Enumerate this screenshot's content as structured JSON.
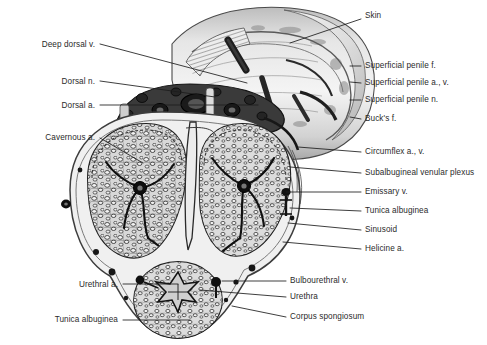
{
  "figure": {
    "width": 487,
    "height": 345,
    "background": "#ffffff",
    "ink_color": "#2b2b2b",
    "leader_color": "#1c1c1c"
  },
  "labels_left": [
    {
      "id": "deep-dorsal-v",
      "text": "Deep dorsal v.",
      "text_x": 95,
      "text_y": 46,
      "line": [
        [
          100,
          44
        ],
        [
          247,
          83
        ]
      ]
    },
    {
      "id": "dorsal-n",
      "text": "Dorsal n.",
      "text_x": 95,
      "text_y": 83,
      "line": [
        [
          100,
          81
        ],
        [
          215,
          97
        ]
      ]
    },
    {
      "id": "dorsal-a",
      "text": "Dorsal a.",
      "text_x": 95,
      "text_y": 107,
      "line": [
        [
          100,
          105
        ],
        [
          258,
          105
        ]
      ]
    },
    {
      "id": "cavernous-a",
      "text": "Cavernous a.",
      "text_x": 95,
      "text_y": 139,
      "line": [
        [
          100,
          138
        ],
        [
          143,
          163
        ]
      ]
    },
    {
      "id": "urethral-a",
      "text": "Urethral a.",
      "text_x": 118,
      "text_y": 286,
      "line": [
        [
          123,
          284
        ],
        [
          178,
          284
        ]
      ]
    },
    {
      "id": "tunica-albuginea-l",
      "text": "Tunica albuginea",
      "text_x": 118,
      "text_y": 321,
      "line": [
        [
          123,
          320
        ],
        [
          190,
          320
        ]
      ]
    }
  ],
  "labels_right": [
    {
      "id": "skin",
      "text": "Skin",
      "text_x": 365,
      "text_y": 17,
      "line": [
        [
          361,
          19
        ],
        [
          290,
          43
        ]
      ]
    },
    {
      "id": "superficial-penile-f",
      "text": "Superficial penile f.",
      "text_x": 365,
      "text_y": 67,
      "line": [
        [
          361,
          66
        ],
        [
          350,
          66
        ]
      ]
    },
    {
      "id": "superficial-penile-a-v",
      "text": "Superficial penile a., v.",
      "text_x": 365,
      "text_y": 84,
      "line": [
        [
          361,
          83
        ],
        [
          350,
          82
        ]
      ]
    },
    {
      "id": "superficial-penile-n",
      "text": "Superficial penile n.",
      "text_x": 365,
      "text_y": 101,
      "line": [
        [
          361,
          100
        ],
        [
          350,
          100
        ]
      ]
    },
    {
      "id": "bucks-f",
      "text": "Buck's f.",
      "text_x": 365,
      "text_y": 120,
      "line": [
        [
          361,
          119
        ],
        [
          350,
          117
        ]
      ]
    },
    {
      "id": "circumflex-a-v",
      "text": "Circumflex a., v.",
      "text_x": 365,
      "text_y": 153,
      "line": [
        [
          361,
          152
        ],
        [
          298,
          147
        ]
      ]
    },
    {
      "id": "subalbugineal-venular-plexus",
      "text": "Subalbugineal venular plexus",
      "text_x": 365,
      "text_y": 174,
      "line": [
        [
          361,
          173
        ],
        [
          290,
          167
        ]
      ]
    },
    {
      "id": "emissary-v",
      "text": "Emissary v.",
      "text_x": 365,
      "text_y": 193,
      "line": [
        [
          361,
          192
        ],
        [
          286,
          192
        ]
      ]
    },
    {
      "id": "tunica-albuginea-r",
      "text": "Tunica albuginea",
      "text_x": 365,
      "text_y": 212,
      "line": [
        [
          361,
          211
        ],
        [
          290,
          208
        ]
      ]
    },
    {
      "id": "sinusoid",
      "text": "Sinusoid",
      "text_x": 365,
      "text_y": 231,
      "line": [
        [
          361,
          230
        ],
        [
          288,
          223
        ]
      ]
    },
    {
      "id": "helicine-a",
      "text": "Helicine a.",
      "text_x": 365,
      "text_y": 250,
      "line": [
        [
          361,
          249
        ],
        [
          283,
          242
        ]
      ]
    },
    {
      "id": "bulbourethral-v",
      "text": "Bulbourethral v.",
      "text_x": 290,
      "text_y": 282,
      "line": [
        [
          286,
          281
        ],
        [
          222,
          281
        ]
      ]
    },
    {
      "id": "urethra",
      "text": "Urethra",
      "text_x": 290,
      "text_y": 298,
      "line": [
        [
          286,
          297
        ],
        [
          200,
          290
        ]
      ]
    },
    {
      "id": "corpus-spongiosum",
      "text": "Corpus spongiosum",
      "text_x": 290,
      "text_y": 318,
      "line": [
        [
          286,
          317
        ],
        [
          232,
          306
        ]
      ]
    }
  ],
  "structures": [
    {
      "name": "skin-shaft",
      "description": "outer cylindrical shaft of penis shown in perspective"
    },
    {
      "name": "corpus-cavernosum-left",
      "description": "left erectile body filled with sinusoids"
    },
    {
      "name": "corpus-cavernosum-right",
      "description": "right erectile body filled with sinusoids"
    },
    {
      "name": "corpus-spongiosum",
      "description": "ventral body surrounding the urethra"
    },
    {
      "name": "intercavernous-septum",
      "description": "midline septum between cavernous bodies"
    },
    {
      "name": "urethral-lumen",
      "description": "central star-shaped urethral lumen"
    },
    {
      "name": "neurovascular-bundle",
      "description": "dorsal bundle with deep dorsal vein, arteries and nerves"
    }
  ]
}
